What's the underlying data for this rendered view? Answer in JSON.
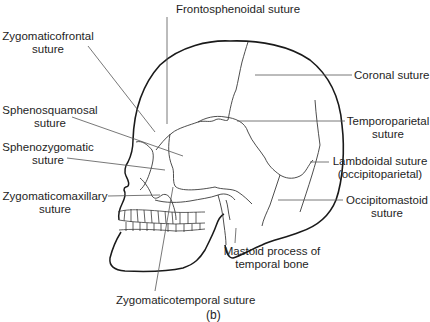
{
  "figure": {
    "caption": "(b)"
  },
  "labels": {
    "frontosphenoidal": {
      "line1": "Frontosphenoidal suture"
    },
    "zygomaticofrontal": {
      "line1": "Zygomaticofrontal",
      "line2": "suture"
    },
    "coronal": {
      "line1": "Coronal suture"
    },
    "sphenosquamosal": {
      "line1": "Sphenosquamosal",
      "line2": "suture"
    },
    "temporoparietal": {
      "line1": "Temporoparietal",
      "line2": "suture"
    },
    "sphenozygomatic": {
      "line1": "Sphenozygomatic",
      "line2": "suture"
    },
    "lambdoidal": {
      "line1": "Lambdoidal suture",
      "line2": "(occipitoparietal)"
    },
    "zygomaticomaxillary": {
      "line1": "Zygomaticomaxillary",
      "line2": "suture"
    },
    "occipitomastoid": {
      "line1": "Occipitomastoid",
      "line2": "suture"
    },
    "mastoid": {
      "line1": "Mastoid process of",
      "line2": "temporal bone"
    },
    "zygomaticotemporal": {
      "line1": "Zygomaticotemporal suture"
    }
  },
  "colors": {
    "outline": "#1a1a1a",
    "leader": "#555555",
    "suture": "#3a3a3a"
  }
}
